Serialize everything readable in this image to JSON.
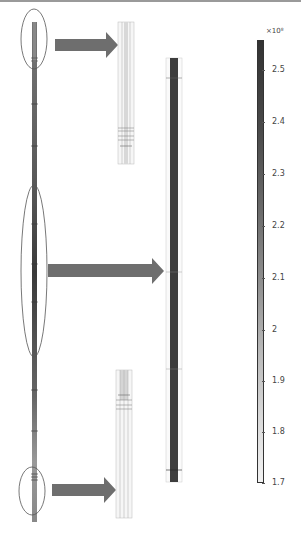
{
  "figure": {
    "colorbar": {
      "multiplier": "×10⁸",
      "ticks": [
        {
          "label": "2.5",
          "y": 70
        },
        {
          "label": "2.4",
          "y": 122
        },
        {
          "label": "2.3",
          "y": 174
        },
        {
          "label": "2.2",
          "y": 226
        },
        {
          "label": "2.1",
          "y": 278
        },
        {
          "label": "2",
          "y": 330
        },
        {
          "label": "1.9",
          "y": 381
        },
        {
          "label": "1.8",
          "y": 432
        },
        {
          "label": "1.7",
          "y": 483
        }
      ],
      "range": [
        1.65,
        2.56
      ],
      "colors": {
        "high": "#333333",
        "low": "#f2f2f2"
      }
    },
    "arrow_color": "#6e6e6e",
    "ellipse_color": "#555555",
    "callouts": [
      "top-end-zoom",
      "middle-section-zoom",
      "bottom-end-zoom"
    ]
  }
}
